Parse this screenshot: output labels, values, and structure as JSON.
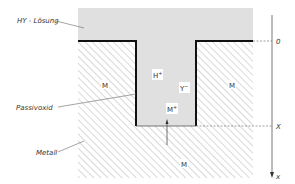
{
  "diagram": {
    "type": "cross-section",
    "labels": {
      "solution": "HY - Lösung",
      "passive_oxide": "Passivoxid",
      "metal": "Metall"
    },
    "regions": {
      "metal_left": "M",
      "metal_right": "M",
      "metal_bottom": "M"
    },
    "ions": {
      "h_plus": "H",
      "h_plus_charge": "+",
      "y_minus": "Y",
      "y_minus_charge": "−",
      "m_plus": "M",
      "m_plus_charge": "+"
    },
    "axis": {
      "zero": "0",
      "depth": "X",
      "variable": "x"
    },
    "colors": {
      "solution_fill": "#e0e0e0",
      "hatch": "#9a9a9a",
      "outline": "#111111",
      "text": "#333333"
    }
  }
}
